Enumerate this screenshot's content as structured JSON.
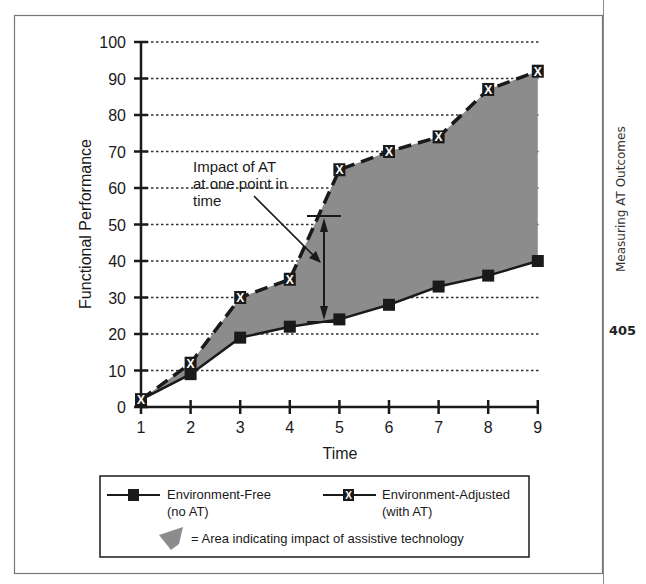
{
  "page": {
    "side_title": "Measuring AT Outcomes",
    "page_number": "405"
  },
  "chart_data": {
    "type": "line",
    "title": "",
    "xlabel": "Time",
    "ylabel": "Functional Performance",
    "x": [
      1,
      2,
      3,
      4,
      5,
      6,
      7,
      8,
      9
    ],
    "xticks": [
      "1",
      "2",
      "3",
      "4",
      "5",
      "6",
      "7",
      "8",
      "9"
    ],
    "yticks": [
      "0",
      "10",
      "20",
      "30",
      "40",
      "50",
      "60",
      "70",
      "80",
      "90",
      "100"
    ],
    "ylim": [
      0,
      100
    ],
    "xlim": [
      1,
      9
    ],
    "grid": "horizontal dotted",
    "series": [
      {
        "name": "Environment-Free (no AT)",
        "marker": "filled-square",
        "line": "solid",
        "values": [
          2,
          9,
          19,
          22,
          24,
          28,
          33,
          36,
          40
        ]
      },
      {
        "name": "Environment-Adjusted (with AT)",
        "marker": "x-box",
        "line": "dashed",
        "values": [
          2,
          12,
          30,
          35,
          65,
          70,
          74,
          87,
          92
        ]
      }
    ],
    "fill_between": {
      "description": "Area indicating impact of assistive technology",
      "color": "#8c8c8c"
    },
    "annotations": [
      {
        "text": "Impact of AT at one point in time",
        "x": 4.7,
        "y_from": 24,
        "y_to": 52,
        "type": "double-arrow"
      }
    ],
    "legend": {
      "position": "bottom",
      "entries": [
        {
          "label_line1": "Environment-Free",
          "label_line2": "(no AT)"
        },
        {
          "label_line1": "Environment-Adjusted",
          "label_line2": "(with AT)"
        },
        {
          "label": "= Area indicating impact of assistive technology"
        }
      ]
    }
  },
  "annotation": {
    "line1": "Impact of AT",
    "line2": "at one point in",
    "line3": "time"
  },
  "colors": {
    "fill": "#8c8c8c",
    "line": "#1a1a1a",
    "grid": "#333333"
  }
}
